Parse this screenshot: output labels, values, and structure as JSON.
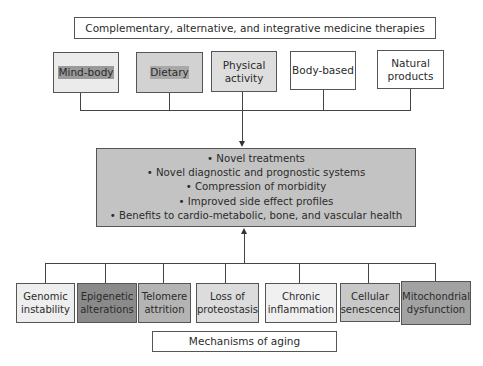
{
  "top_title": "Complementary, alternative, and integrative medicine therapies",
  "therapies": [
    {
      "label": "Mind-body",
      "color": "#ebebeb"
    },
    {
      "label": "Dietary",
      "color": "#9a9a9a"
    },
    {
      "label": "Physical activity",
      "color": "#d2d2d2"
    },
    {
      "label": "Body-based",
      "color": "#a8a8a8"
    },
    {
      "label": "Natural products",
      "color": "#dedede"
    }
  ],
  "outcomes": [
    "• Novel treatments",
    "• Novel diagnostic and prognostic systems",
    "• Compression of morbidity",
    "• Improved side effect profiles",
    "• Benefits to cardio-metabolic, bone, and vascular health"
  ],
  "outcomes_color": "#c3c3c3",
  "mechanisms": [
    {
      "label": "Genomic instability",
      "color": "#eeeeee"
    },
    {
      "label": "Epigenetic alterations",
      "color": "#8a8a8a"
    },
    {
      "label": "Telomere attrition",
      "color": "#b4b4b4"
    },
    {
      "label": "Loss of proteostasis",
      "color": "#dcdcdc"
    },
    {
      "label": "Chronic inflammation",
      "color": "#f0f0f0"
    },
    {
      "label": "Cellular senescence",
      "color": "#c8c8c8"
    },
    {
      "label": "Mitochondrial dysfunction",
      "color": "#a2a2a2"
    }
  ],
  "bottom_title": "Mechanisms of aging"
}
